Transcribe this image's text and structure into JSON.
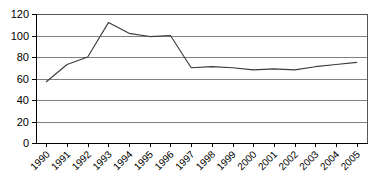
{
  "chart_data": {
    "type": "line",
    "title": "",
    "subtitle": "",
    "xlabel": "",
    "ylabel": "",
    "categories": [
      "1990",
      "1991",
      "1992",
      "1993",
      "1994",
      "1995",
      "1996",
      "1997",
      "1998",
      "1999",
      "2000",
      "2001",
      "2002",
      "2003",
      "2004",
      "2005"
    ],
    "values": [
      57,
      73,
      80,
      112,
      102,
      99,
      100,
      70,
      71,
      70,
      68,
      69,
      68,
      71,
      73,
      75
    ],
    "series": [
      {
        "name": "series-1",
        "values": [
          57,
          73,
          80,
          112,
          102,
          99,
          100,
          70,
          71,
          70,
          68,
          69,
          68,
          71,
          73,
          75
        ],
        "color": "#3a3a3a"
      }
    ],
    "ylim": [
      0,
      120
    ],
    "ytick_step": 20,
    "yticks": [
      0,
      20,
      40,
      60,
      80,
      100,
      120
    ],
    "ytick_labels": [
      "0",
      "20",
      "40",
      "60",
      "80",
      "100",
      "120"
    ],
    "xtick_labels": [
      "1990",
      "1991",
      "1992",
      "1993",
      "1994",
      "1995",
      "1996",
      "1997",
      "1998",
      "1999",
      "2000",
      "2001",
      "2002",
      "2003",
      "2004",
      "2005"
    ],
    "xtick_rotation_degrees": -45,
    "grid": true,
    "grid_axis": "y",
    "legend": false,
    "legend_position": "none",
    "annotations": [],
    "colors": {
      "line": "#3a3a3a",
      "grid": "#808080",
      "axis": "#000000",
      "frame": "#555555",
      "background": "#ffffff",
      "text": "#000000"
    }
  },
  "layout": {
    "plot_left": 36,
    "plot_right": 367,
    "plot_top": 14,
    "plot_bottom": 143
  }
}
